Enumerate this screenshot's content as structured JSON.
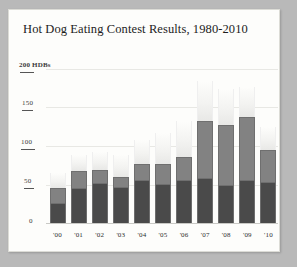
{
  "figure": {
    "background_color": "#b9b9b9",
    "card_color": "#fdfdfb"
  },
  "chart_data": {
    "type": "bar",
    "title": "Hot Dog Eating Contest Results, 1980-2010",
    "subtitle": "",
    "xlabel": "",
    "ylabel": "200 HDBs",
    "categories": [
      "'00",
      "'01",
      "'02",
      "'03",
      "'04",
      "'05",
      "'06",
      "'07",
      "'08",
      "'09",
      "'10"
    ],
    "stacked": true,
    "series": [
      {
        "name": "lower",
        "color": "#4a4a4a",
        "values": [
          25,
          44,
          50,
          45,
          54,
          49,
          54,
          57,
          48,
          54,
          52
        ]
      },
      {
        "name": "middle",
        "color": "#828282",
        "values": [
          20,
          23,
          19,
          15,
          22,
          27,
          31,
          75,
          79,
          83,
          43
        ]
      },
      {
        "name": "upper",
        "color": "#f3f3f1",
        "values": [
          20,
          21,
          23,
          28,
          32,
          41,
          47,
          52,
          47,
          39,
          30
        ]
      }
    ],
    "totals": [
      65,
      88,
      92,
      88,
      108,
      117,
      132,
      184,
      174,
      176,
      125
    ],
    "yticks": [
      0,
      50,
      100,
      150,
      200
    ],
    "ytick_labels": [
      "0",
      "50",
      "100",
      "150",
      "200 HDBs"
    ],
    "ylim": [
      0,
      200
    ],
    "grid": true,
    "legend": "none"
  }
}
